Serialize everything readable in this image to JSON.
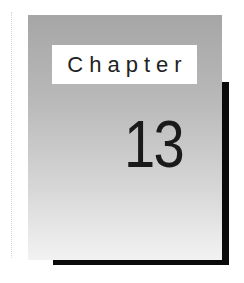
{
  "chapter": {
    "label": "Chapter",
    "number": "13"
  },
  "colors": {
    "panel_top": "#a6a6a6",
    "panel_bottom": "#f2f2f2",
    "shadow": "#0a0a0a",
    "label_bg": "#ffffff",
    "text": "#1a1a1a"
  }
}
